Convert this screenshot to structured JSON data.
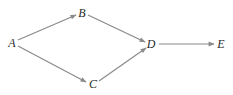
{
  "diagram": {
    "type": "directed-graph",
    "edge_color": "#8a8a8a",
    "label_color": "#2a2a2a",
    "nodes": [
      {
        "id": "A",
        "label": "A",
        "x": 12,
        "y": 43
      },
      {
        "id": "B",
        "label": "B",
        "x": 82,
        "y": 13
      },
      {
        "id": "C",
        "label": "C",
        "x": 93,
        "y": 84
      },
      {
        "id": "D",
        "label": "D",
        "x": 151,
        "y": 44
      },
      {
        "id": "E",
        "label": "E",
        "x": 221,
        "y": 44
      }
    ],
    "edges": [
      {
        "from": "A",
        "to": "B"
      },
      {
        "from": "A",
        "to": "C"
      },
      {
        "from": "B",
        "to": "D"
      },
      {
        "from": "C",
        "to": "D"
      },
      {
        "from": "D",
        "to": "E"
      }
    ]
  }
}
